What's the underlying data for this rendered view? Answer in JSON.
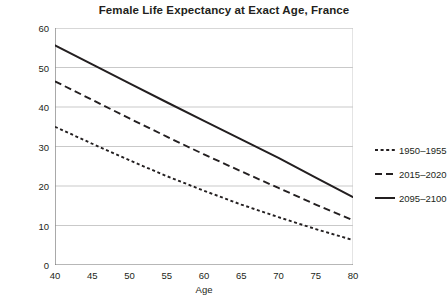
{
  "chart_data": {
    "type": "line",
    "title": "Female Life Expectancy at Exact Age, France",
    "xlabel": "Age",
    "ylabel": "Years",
    "xlim": [
      40,
      80
    ],
    "ylim": [
      0,
      60
    ],
    "xticks": [
      40,
      45,
      50,
      55,
      60,
      65,
      70,
      75,
      80
    ],
    "yticks": [
      0,
      10,
      20,
      30,
      40,
      50,
      60
    ],
    "grid": "horizontal",
    "legend_position": "right",
    "x": [
      40,
      45,
      50,
      55,
      60,
      65,
      70,
      75,
      80
    ],
    "series": [
      {
        "name": "1950–1955",
        "style": "dotted",
        "color": "#231f20",
        "values": [
          35.0,
          30.7,
          26.5,
          22.5,
          18.8,
          15.3,
          12.1,
          9.1,
          6.3
        ]
      },
      {
        "name": "2015–2020",
        "style": "dashed",
        "color": "#231f20",
        "values": [
          46.5,
          41.8,
          37.1,
          32.5,
          28.0,
          23.7,
          19.5,
          15.3,
          11.3
        ]
      },
      {
        "name": "2095–2100",
        "style": "solid",
        "color": "#231f20",
        "values": [
          55.6,
          50.8,
          46.0,
          41.2,
          36.5,
          31.8,
          27.1,
          22.1,
          17.2
        ]
      }
    ]
  },
  "colors": {
    "ink": "#231f20",
    "grid": "#c9c9c9",
    "axis": "#6f6f6f",
    "background": "#ffffff"
  }
}
